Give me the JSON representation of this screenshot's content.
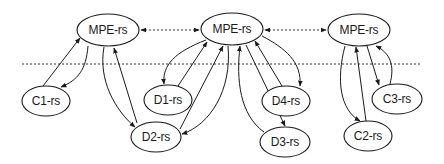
{
  "diagram": {
    "separator": {
      "y": 64,
      "x1": 22,
      "x2": 420,
      "style": "dotted"
    },
    "nodes": [
      {
        "id": "mpe1",
        "label": "MPE-rs",
        "cx": 108,
        "cy": 30,
        "rx": 31,
        "ry": 16
      },
      {
        "id": "mpe2",
        "label": "MPE-rs",
        "cx": 232,
        "cy": 29,
        "rx": 31,
        "ry": 16
      },
      {
        "id": "mpe3",
        "label": "MPE-rs",
        "cx": 359,
        "cy": 30,
        "rx": 31,
        "ry": 16
      },
      {
        "id": "c1",
        "label": "C1-rs",
        "cx": 46,
        "cy": 101,
        "rx": 24,
        "ry": 15
      },
      {
        "id": "d1",
        "label": "D1-rs",
        "cx": 168,
        "cy": 100,
        "rx": 24,
        "ry": 15
      },
      {
        "id": "d2",
        "label": "D2-rs",
        "cx": 156,
        "cy": 137,
        "rx": 25,
        "ry": 15
      },
      {
        "id": "d4",
        "label": "D4-rs",
        "cx": 286,
        "cy": 101,
        "rx": 24,
        "ry": 15
      },
      {
        "id": "d3",
        "label": "D3-rs",
        "cx": 285,
        "cy": 142,
        "rx": 25,
        "ry": 15
      },
      {
        "id": "c2",
        "label": "C2-rs",
        "cx": 368,
        "cy": 136,
        "rx": 24,
        "ry": 15
      },
      {
        "id": "c3",
        "label": "C3-rs",
        "cx": 397,
        "cy": 99,
        "rx": 25,
        "ry": 15
      }
    ],
    "edges": [
      {
        "from": "mpe1",
        "to": "mpe2",
        "style": "dotted",
        "bidirectional": true
      },
      {
        "from": "mpe2",
        "to": "mpe3",
        "style": "dotted",
        "bidirectional": true
      },
      {
        "from": "c1",
        "to": "mpe1"
      },
      {
        "from": "mpe1",
        "to": "c1"
      },
      {
        "from": "mpe1",
        "to": "d2"
      },
      {
        "from": "d2",
        "to": "mpe1"
      },
      {
        "from": "mpe2",
        "to": "d1"
      },
      {
        "from": "d1",
        "to": "mpe2"
      },
      {
        "from": "d2",
        "to": "mpe2"
      },
      {
        "from": "mpe2",
        "to": "d2"
      },
      {
        "from": "mpe2",
        "to": "d3"
      },
      {
        "from": "d3",
        "to": "mpe2"
      },
      {
        "from": "mpe2",
        "to": "d4"
      },
      {
        "from": "d4",
        "to": "mpe2"
      },
      {
        "from": "mpe3",
        "to": "c2"
      },
      {
        "from": "c2",
        "to": "mpe3"
      },
      {
        "from": "mpe3",
        "to": "c3"
      },
      {
        "from": "c3",
        "to": "mpe3"
      }
    ],
    "colors": {
      "stroke": "#1a1a1a",
      "background": "#ffffff"
    }
  }
}
